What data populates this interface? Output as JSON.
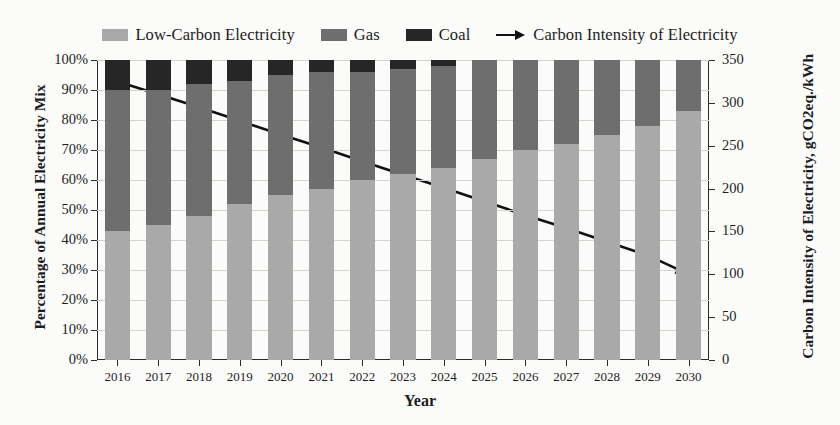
{
  "chart_data": {
    "type": "bar",
    "subtype": "stacked-bar-with-line",
    "title": "",
    "xlabel": "Year",
    "ylabel": "Percentage of Annual Electricity Mix",
    "y2label": "Carbon Intensity of Electricity, gCO2eq./kWh",
    "categories": [
      "2016",
      "2017",
      "2018",
      "2019",
      "2020",
      "2021",
      "2022",
      "2023",
      "2024",
      "2025",
      "2026",
      "2027",
      "2028",
      "2029",
      "2030"
    ],
    "ylim": [
      0,
      100
    ],
    "y2lim": [
      0,
      350
    ],
    "yticks": [
      "0%",
      "10%",
      "20%",
      "30%",
      "40%",
      "50%",
      "60%",
      "70%",
      "80%",
      "90%",
      "100%"
    ],
    "y2ticks": [
      "0",
      "50",
      "100",
      "150",
      "200",
      "250",
      "300",
      "350"
    ],
    "grid": true,
    "legend_position": "top-center",
    "series": [
      {
        "name": "Low-Carbon Electricity",
        "color": "#a9a9a9",
        "axis": "left",
        "values": [
          43,
          45,
          48,
          52,
          55,
          57,
          60,
          62,
          64,
          67,
          70,
          72,
          75,
          78,
          83
        ]
      },
      {
        "name": "Gas",
        "color": "#6e6e6e",
        "axis": "left",
        "values": [
          47,
          45,
          44,
          41,
          40,
          39,
          36,
          35,
          34,
          33,
          30,
          28,
          25,
          22,
          17
        ]
      },
      {
        "name": "Coal",
        "color": "#262626",
        "axis": "left",
        "values": [
          10,
          10,
          8,
          7,
          5,
          4,
          4,
          3,
          2,
          0,
          0,
          0,
          0,
          0,
          0
        ]
      },
      {
        "name": "Carbon Intensity of Electricity",
        "color": "#111111",
        "axis": "right",
        "type": "line",
        "marker": "arrow-end",
        "values": [
          325,
          310,
          295,
          279,
          263,
          248,
          232,
          216,
          201,
          185,
          169,
          154,
          138,
          122,
          100
        ]
      }
    ]
  },
  "legend": {
    "items": [
      {
        "label": "Low-Carbon Electricity",
        "swatch": "#a9a9a9",
        "kind": "swatch"
      },
      {
        "label": "Gas",
        "swatch": "#6e6e6e",
        "kind": "swatch"
      },
      {
        "label": "Coal",
        "swatch": "#262626",
        "kind": "swatch"
      },
      {
        "label": "Carbon Intensity of Electricity",
        "swatch": "#111111",
        "kind": "line-arrow"
      }
    ]
  },
  "axes": {
    "x_title": "Year",
    "y_left_title": "Percentage of Annual Electricity Mix",
    "y_right_title": "Carbon Intensity of Electricity, gCO2eq./kWh"
  },
  "colors": {
    "low_carbon": "#a9a9a9",
    "gas": "#6e6e6e",
    "coal": "#262626",
    "line": "#111111",
    "grid": "#d3d2ce",
    "axis": "#2b2b2b",
    "background": "#fbfbfa"
  }
}
